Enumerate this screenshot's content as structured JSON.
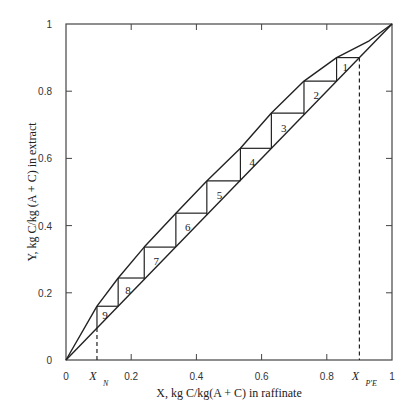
{
  "chart_data": {
    "type": "line",
    "title": "",
    "xlabel": "X,  kg C/kg(A + C) in raffinate",
    "ylabel": "Y, kg C/kg (A + C) in extract",
    "xlim": [
      0,
      1
    ],
    "ylim": [
      0,
      1
    ],
    "grid": false,
    "legend": null,
    "x_ticks": [
      "0",
      "0.2",
      "0.4",
      "0.6",
      "0.8",
      "1"
    ],
    "y_ticks": [
      "0",
      "0.2",
      "0.4",
      "0.6",
      "0.8",
      "1"
    ],
    "series": [
      {
        "name": "Equilibrium curve",
        "x": [
          0,
          0.095,
          0.16,
          0.24,
          0.337,
          0.432,
          0.535,
          0.63,
          0.73,
          0.83,
          0.93,
          1.0
        ],
        "y": [
          0,
          0.16,
          0.244,
          0.336,
          0.437,
          0.533,
          0.63,
          0.735,
          0.83,
          0.9,
          0.95,
          1.0
        ]
      },
      {
        "name": "Operating line",
        "x": [
          0,
          1.0
        ],
        "y": [
          0,
          1.0
        ]
      }
    ],
    "stages": [
      {
        "label": "1",
        "x_left": 0.83,
        "x_right": 0.9,
        "y": 0.9
      },
      {
        "label": "2",
        "x_left": 0.73,
        "x_right": 0.83,
        "y": 0.83
      },
      {
        "label": "3",
        "x_left": 0.63,
        "x_right": 0.73,
        "y": 0.735
      },
      {
        "label": "4",
        "x_left": 0.535,
        "x_right": 0.63,
        "y": 0.63
      },
      {
        "label": "5",
        "x_left": 0.432,
        "x_right": 0.535,
        "y": 0.533
      },
      {
        "label": "6",
        "x_left": 0.337,
        "x_right": 0.432,
        "y": 0.437
      },
      {
        "label": "7",
        "x_left": 0.24,
        "x_right": 0.337,
        "y": 0.336
      },
      {
        "label": "8",
        "x_left": 0.16,
        "x_right": 0.24,
        "y": 0.244
      },
      {
        "label": "9",
        "x_left": 0.095,
        "x_right": 0.16,
        "y": 0.16
      }
    ],
    "annotations": [
      {
        "text": "X",
        "subscript": "N",
        "x": 0.095,
        "style": "dashed vertical"
      },
      {
        "text": "X",
        "subscript": "P'E",
        "x": 0.9,
        "style": "dashed vertical"
      }
    ]
  }
}
